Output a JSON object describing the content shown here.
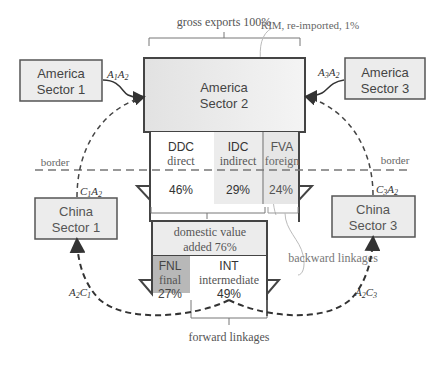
{
  "top_bracket": {
    "label": "gross exports 100%"
  },
  "rim_note": {
    "label": "RIM, re-imported, 1%"
  },
  "center_box": {
    "line1": "America",
    "line2": "Sector 2"
  },
  "america_sector1": {
    "line1": "America",
    "line2": "Sector 1",
    "flow_label_a": "A",
    "flow_sub_a": "1",
    "flow_label_b": "A",
    "flow_sub_b": "2"
  },
  "america_sector3": {
    "line1": "America",
    "line2": "Sector 3",
    "flow_label_a": "A",
    "flow_sub_a": "3",
    "flow_label_b": "A",
    "flow_sub_b": "2"
  },
  "china_sector1": {
    "line1": "China",
    "line2": "Sector 1",
    "in_label_a": "C",
    "in_sub_a": "1",
    "in_label_b": "A",
    "in_sub_b": "2",
    "out_label_a": "A",
    "out_sub_a": "2",
    "out_label_b": "C",
    "out_sub_b": "1"
  },
  "china_sector3": {
    "line1": "China",
    "line2": "Sector 3",
    "in_label_a": "C",
    "in_sub_a": "3",
    "in_label_b": "A",
    "in_sub_b": "2",
    "out_label_a": "A",
    "out_sub_a": "2",
    "out_label_b": "C",
    "out_sub_b": "3"
  },
  "border": {
    "left_label": "border",
    "right_label": "border"
  },
  "decomposition": [
    {
      "code": "DDC",
      "name": "direct",
      "pct": "46%",
      "fill": "#ffffff"
    },
    {
      "code": "IDC",
      "name": "indirect",
      "pct": "29%",
      "fill": "#ececec"
    },
    {
      "code": "FVA",
      "name": "foreign",
      "pct": "24%",
      "fill": "#e4e4e4"
    }
  ],
  "domestic_value_added": {
    "line1": "domestic value",
    "line2": "added 76%"
  },
  "dva_split": [
    {
      "code": "FNL",
      "name": "final",
      "pct": "27%",
      "fill": "#b8b8b8"
    },
    {
      "code": "INT",
      "name": "intermediate",
      "pct": "49%",
      "fill": "#ffffff"
    }
  ],
  "backward_linkages": {
    "label": "backward linkages"
  },
  "forward_linkages": {
    "label": "forward linkages"
  },
  "colors": {
    "box_fill": "#ececec",
    "box_stroke": "#555555",
    "dash": "#333333",
    "border_dash": "#666666"
  }
}
